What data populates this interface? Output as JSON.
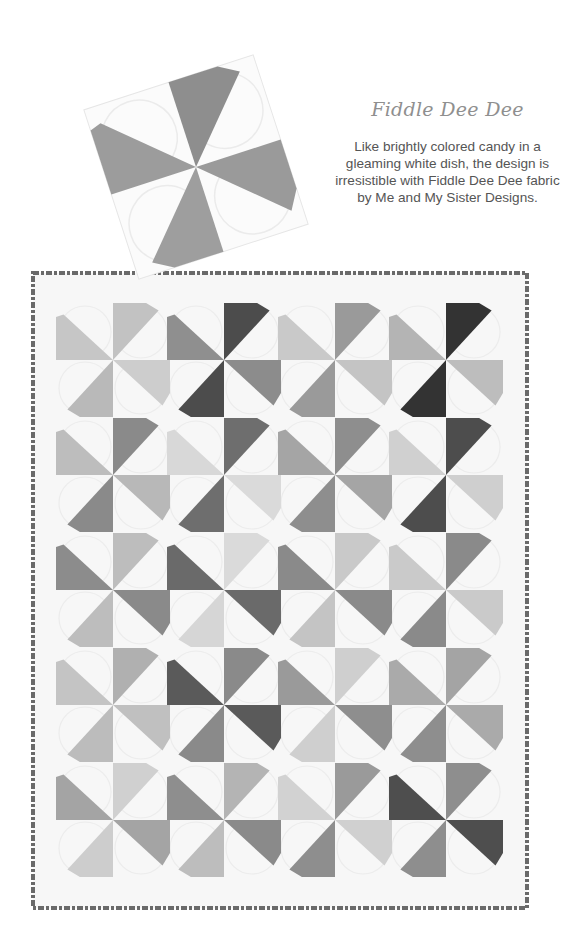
{
  "feature": {
    "title": "Fiddle Dee Dee",
    "description_lines": [
      "Like brightly colored candy in a",
      "gleaming white dish, the design is",
      "irresistible with Fiddle Dee Dee fabric",
      "by Me and My Sister Designs."
    ]
  },
  "detail_block": {
    "center": [
      196,
      167
    ],
    "size": 178,
    "rotation_deg": -18,
    "blade_tones": [
      "#9c9c9c",
      "#8e8e8e",
      "#9a9a9a",
      "#9e9e9e"
    ]
  },
  "quilt": {
    "bounds": {
      "x": 33,
      "y": 273,
      "w": 494,
      "h": 635
    },
    "binding_color": "#6a6a6a",
    "background": "#f7f7f7",
    "columns": [
      113,
      224,
      335,
      446
    ],
    "rows": [
      360,
      475,
      590,
      705,
      820
    ],
    "block_half": 57,
    "blocks": [
      [
        [
          "#c6c6c6",
          "#c2c2c2",
          "#cdcdcd",
          "#b9b9b9"
        ],
        [
          "#8f8f8f",
          "#4c4c4c",
          "#8c8c8c",
          "#4c4c4c"
        ],
        [
          "#c9c9c9",
          "#9a9a9a",
          "#c4c4c4",
          "#9a9a9a"
        ],
        [
          "#b4b4b4",
          "#333333",
          "#bdbdbd",
          "#333333"
        ]
      ],
      [
        [
          "#bdbdbd",
          "#8a8a8a",
          "#b8b8b8",
          "#8a8a8a"
        ],
        [
          "#d8d8d8",
          "#6e6e6e",
          "#dadada",
          "#6e6e6e"
        ],
        [
          "#a5a5a5",
          "#8e8e8e",
          "#a5a5a5",
          "#8e8e8e"
        ],
        [
          "#d0d0d0",
          "#4d4d4d",
          "#cfcfcf",
          "#4d4d4d"
        ]
      ],
      [
        [
          "#8c8c8c",
          "#bdbdbd",
          "#8a8a8a",
          "#bdbdbd"
        ],
        [
          "#6a6a6a",
          "#dadada",
          "#6a6a6a",
          "#d6d6d6"
        ],
        [
          "#8a8a8a",
          "#c9c9c9",
          "#8a8a8a",
          "#c4c4c4"
        ],
        [
          "#cacaca",
          "#8a8a8a",
          "#cacaca",
          "#8a8a8a"
        ]
      ],
      [
        [
          "#c4c4c4",
          "#b0b0b0",
          "#c0c0c0",
          "#bcbcbc"
        ],
        [
          "#5a5a5a",
          "#8a8a8a",
          "#5a5a5a",
          "#8a8a8a"
        ],
        [
          "#9a9a9a",
          "#cfcfcf",
          "#8e8e8e",
          "#cfcfcf"
        ],
        [
          "#aaaaaa",
          "#a4a4a4",
          "#aaaaaa",
          "#8e8e8e"
        ]
      ],
      [
        [
          "#a4a4a4",
          "#d0d0d0",
          "#a4a4a4",
          "#cdcdcd"
        ],
        [
          "#8e8e8e",
          "#b4b4b4",
          "#8a8a8a",
          "#bdbdbd"
        ],
        [
          "#d2d2d2",
          "#9a9a9a",
          "#d0d0d0",
          "#8e8e8e"
        ],
        [
          "#4e4e4e",
          "#8e8e8e",
          "#4e4e4e",
          "#8e8e8e"
        ]
      ]
    ]
  }
}
